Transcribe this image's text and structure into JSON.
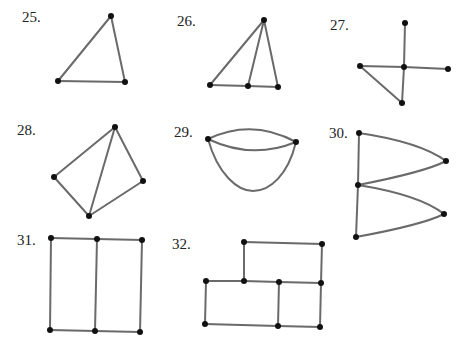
{
  "figures": [
    {
      "label": "25.",
      "label_pos": [
        22,
        10
      ],
      "vertices": [
        [
          111,
          16
        ],
        [
          58,
          81
        ],
        [
          125,
          82
        ]
      ],
      "edges": [
        [
          0,
          1
        ],
        [
          1,
          2
        ],
        [
          2,
          0
        ]
      ],
      "curves": []
    },
    {
      "label": "26.",
      "label_pos": [
        177,
        14
      ],
      "vertices": [
        [
          264,
          20
        ],
        [
          210,
          85
        ],
        [
          248,
          86
        ],
        [
          278,
          87
        ]
      ],
      "edges": [
        [
          0,
          1
        ],
        [
          0,
          2
        ],
        [
          0,
          3
        ],
        [
          1,
          2
        ],
        [
          2,
          3
        ]
      ],
      "curves": []
    },
    {
      "label": "27.",
      "label_pos": [
        330,
        18
      ],
      "vertices": [
        [
          405,
          23
        ],
        [
          404,
          67
        ],
        [
          360,
          66
        ],
        [
          448,
          69
        ],
        [
          402,
          103
        ]
      ],
      "edges": [
        [
          0,
          1
        ],
        [
          2,
          1
        ],
        [
          1,
          3
        ],
        [
          1,
          4
        ],
        [
          2,
          4
        ]
      ],
      "curves": []
    },
    {
      "label": "28.",
      "label_pos": [
        17,
        123
      ],
      "vertices": [
        [
          115,
          127
        ],
        [
          54,
          177
        ],
        [
          89,
          216
        ],
        [
          143,
          181
        ]
      ],
      "edges": [
        [
          0,
          1
        ],
        [
          1,
          2
        ],
        [
          2,
          3
        ],
        [
          3,
          0
        ],
        [
          0,
          2
        ]
      ],
      "curves": []
    },
    {
      "label": "29.",
      "label_pos": [
        174,
        125
      ],
      "vertices": [
        [
          208,
          139
        ],
        [
          296,
          142
        ]
      ],
      "edges": [],
      "curves": [
        "M208,139 Q252,118 296,142",
        "M208,139 Q252,160 296,142",
        "M208,139 C218,175 238,191 253,191 C270,191 288,175 296,142"
      ]
    },
    {
      "label": "30.",
      "label_pos": [
        329,
        126
      ],
      "vertices": [
        [
          359,
          133
        ],
        [
          446,
          161
        ],
        [
          358,
          185
        ],
        [
          444,
          214
        ],
        [
          356,
          237
        ]
      ],
      "edges": [
        [
          0,
          2
        ],
        [
          2,
          4
        ]
      ],
      "curves": [
        "M359,133 Q420,142 446,161",
        "M358,185 Q425,172 446,161",
        "M358,185 Q420,195 444,214",
        "M356,237 Q422,225 444,214"
      ]
    },
    {
      "label": "31.",
      "label_pos": [
        17,
        233
      ],
      "vertices": [
        [
          51,
          238
        ],
        [
          97,
          239
        ],
        [
          142,
          240
        ],
        [
          50,
          330
        ],
        [
          95,
          331
        ],
        [
          140,
          332
        ]
      ],
      "edges": [
        [
          0,
          1
        ],
        [
          1,
          2
        ],
        [
          3,
          4
        ],
        [
          4,
          5
        ],
        [
          0,
          3
        ],
        [
          1,
          4
        ],
        [
          2,
          5
        ]
      ],
      "curves": []
    },
    {
      "label": "32.",
      "label_pos": [
        172,
        237
      ],
      "vertices": [
        [
          244,
          242
        ],
        [
          322,
          244
        ],
        [
          206,
          281
        ],
        [
          244,
          281
        ],
        [
          279,
          282
        ],
        [
          321,
          283
        ],
        [
          205,
          324
        ],
        [
          278,
          326
        ],
        [
          320,
          327
        ]
      ],
      "edges": [
        [
          0,
          1
        ],
        [
          0,
          3
        ],
        [
          1,
          5
        ],
        [
          2,
          3
        ],
        [
          3,
          4
        ],
        [
          4,
          5
        ],
        [
          2,
          6
        ],
        [
          6,
          7
        ],
        [
          7,
          8
        ],
        [
          4,
          7
        ],
        [
          5,
          8
        ]
      ],
      "curves": []
    }
  ]
}
